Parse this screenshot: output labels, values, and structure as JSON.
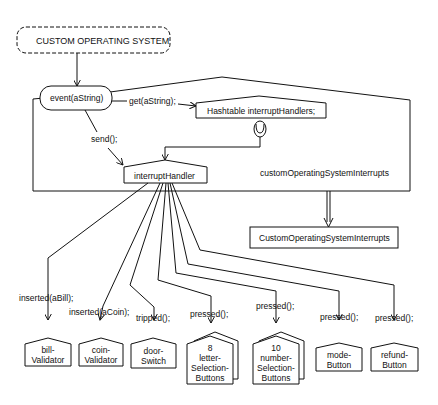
{
  "system": {
    "label": "CUSTOM OPERATING SYSTEM"
  },
  "container": {
    "label": "customOperatingSystemInterrupts"
  },
  "nodes": {
    "event": "event(aString)",
    "hashtable": "Hashtable interruptHandlers;",
    "interruptHandler": "interruptHandler",
    "class": "CustomOperatingSystemInterrupts"
  },
  "messages": {
    "get": "get(aString);",
    "send": "send();"
  },
  "targets": [
    {
      "message": "inserted(aBill);",
      "label": "bill-\nValidator",
      "l1": "bill-",
      "l2": "Validator",
      "multi": false
    },
    {
      "message": "inserted(aCoin);",
      "label": "coin-\nValidator",
      "l1": "coin-",
      "l2": "Validator",
      "multi": false
    },
    {
      "message": "tripped();",
      "label": "door-\nSwitch",
      "l1": "door-",
      "l2": "Switch",
      "multi": false
    },
    {
      "message": "pressed();",
      "count": "8",
      "l1": "letter-",
      "l2": "Selection-",
      "l3": "Buttons",
      "multi": true
    },
    {
      "message": "pressed();",
      "count": "10",
      "l1": "number-",
      "l2": "Selection-",
      "l3": "Buttons",
      "multi": true
    },
    {
      "message": "pressed();",
      "l1": "mode-",
      "l2": "Button",
      "multi": false
    },
    {
      "message": "pressed();",
      "l1": "refund-",
      "l2": "Button",
      "multi": false
    }
  ]
}
